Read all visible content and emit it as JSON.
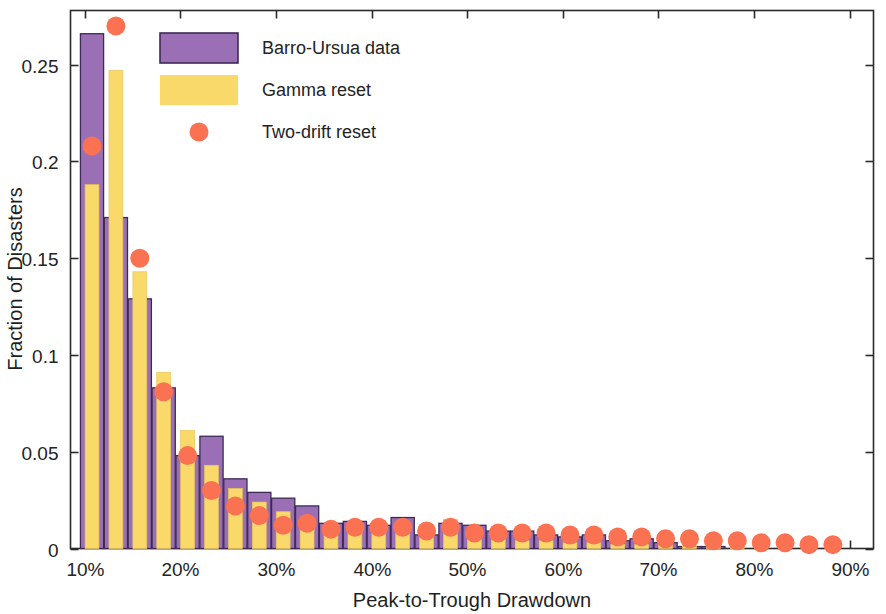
{
  "chart_data": {
    "type": "bar",
    "title": "",
    "xlabel": "Peak-to-Trough Drawdown",
    "ylabel": "Fraction of Disasters",
    "xlim": [
      0.085,
      0.925
    ],
    "ylim": [
      0,
      0.278
    ],
    "grid": false,
    "legend_position": "top-left-inside",
    "xticks": [
      0.1,
      0.2,
      0.3,
      0.4,
      0.5,
      0.6,
      0.7,
      0.8,
      0.9
    ],
    "xticklabels": [
      "10%",
      "20%",
      "30%",
      "40%",
      "50%",
      "60%",
      "70%",
      "80%",
      "90%"
    ],
    "yticks": [
      0,
      0.05,
      0.1,
      0.15,
      0.2,
      0.25
    ],
    "yticklabels": [
      "0",
      "0.05",
      "0.1",
      "0.15",
      "0.2",
      "0.25"
    ],
    "bin_centers": [
      0.1075,
      0.1325,
      0.1575,
      0.1825,
      0.2075,
      0.2325,
      0.2575,
      0.2825,
      0.3075,
      0.3325,
      0.3575,
      0.3825,
      0.4075,
      0.4325,
      0.4575,
      0.4825,
      0.5075,
      0.5325,
      0.5575,
      0.5825,
      0.6075,
      0.6325,
      0.6575,
      0.6825,
      0.7075,
      0.7325,
      0.7575,
      0.7825,
      0.8075,
      0.8325,
      0.8575,
      0.8825
    ],
    "series": [
      {
        "name": "Barro-Ursua data",
        "kind": "bar",
        "color": "#9B6FB5",
        "edge_color": "#3D2B56",
        "values": [
          0.266,
          0.171,
          0.129,
          0.083,
          0.048,
          0.058,
          0.036,
          0.029,
          0.026,
          0.022,
          0.013,
          0.014,
          0.012,
          0.016,
          0.007,
          0.013,
          0.012,
          0.009,
          0.009,
          0.007,
          0.006,
          0.007,
          0.004,
          0.005,
          0.003,
          0.001,
          0.001,
          0.0,
          0.0,
          0.0,
          0.0,
          0.0
        ]
      },
      {
        "name": "Gamma reset",
        "kind": "bar",
        "color": "#FAD96B",
        "edge_color": "#E8C65A",
        "values": [
          0.188,
          0.247,
          0.143,
          0.091,
          0.061,
          0.043,
          0.031,
          0.024,
          0.019,
          0.015,
          0.012,
          0.01,
          0.009,
          0.008,
          0.006,
          0.015,
          0.005,
          0.005,
          0.004,
          0.004,
          0.003,
          0.003,
          0.002,
          0.002,
          0.002,
          0.001,
          0.001,
          0.001,
          0.0,
          0.0,
          0.0,
          0.0
        ]
      },
      {
        "name": "Two-drift reset",
        "kind": "scatter",
        "color": "#FA7252",
        "values": [
          0.208,
          0.27,
          0.15,
          0.081,
          0.048,
          0.03,
          0.022,
          0.017,
          0.012,
          0.013,
          0.01,
          0.011,
          0.011,
          0.011,
          0.009,
          0.011,
          0.008,
          0.008,
          0.008,
          0.008,
          0.007,
          0.007,
          0.006,
          0.006,
          0.005,
          0.005,
          0.004,
          0.004,
          0.003,
          0.003,
          0.002,
          0.002
        ]
      }
    ]
  },
  "legend": {
    "items": [
      {
        "label": "Barro-Ursua data",
        "marker": "square",
        "color": "#9B6FB5"
      },
      {
        "label": "Gamma reset",
        "marker": "square",
        "color": "#FAD96B"
      },
      {
        "label": "Two-drift reset",
        "marker": "circle",
        "color": "#FA7252"
      }
    ]
  },
  "colors": {
    "purple_fill": "#9B6FB5",
    "purple_edge": "#3D2B56",
    "yellow_fill": "#FAD96B",
    "yellow_edge": "#E8C65A",
    "dot": "#FA7252",
    "axis": "#2B2B2B",
    "background": "#FFFFFF"
  }
}
